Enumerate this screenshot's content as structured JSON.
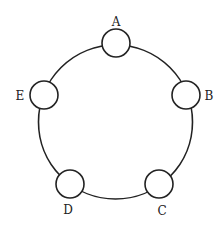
{
  "diagram": {
    "type": "ring-network",
    "colors": {
      "stroke": "#222222",
      "fill": "#ffffff",
      "text": "#222222"
    },
    "ring": {
      "cx": 115.5,
      "cy": 122,
      "r": 77
    },
    "nodes": [
      {
        "id": "A",
        "label": "A",
        "cx": 116,
        "cy": 43,
        "r": 14,
        "label_x": 116,
        "label_y": 26
      },
      {
        "id": "B",
        "label": "B",
        "cx": 186,
        "cy": 95,
        "r": 14,
        "label_x": 209,
        "label_y": 100
      },
      {
        "id": "C",
        "label": "C",
        "cx": 159,
        "cy": 184,
        "r": 14,
        "label_x": 162,
        "label_y": 215
      },
      {
        "id": "D",
        "label": "D",
        "cx": 70,
        "cy": 184,
        "r": 14,
        "label_x": 68,
        "label_y": 214
      },
      {
        "id": "E",
        "label": "E",
        "cx": 44,
        "cy": 95,
        "r": 14,
        "label_x": 20,
        "label_y": 100
      }
    ],
    "edges": [
      {
        "from": "A",
        "to": "B"
      },
      {
        "from": "B",
        "to": "C"
      },
      {
        "from": "C",
        "to": "D"
      },
      {
        "from": "D",
        "to": "E"
      },
      {
        "from": "E",
        "to": "A"
      }
    ]
  }
}
